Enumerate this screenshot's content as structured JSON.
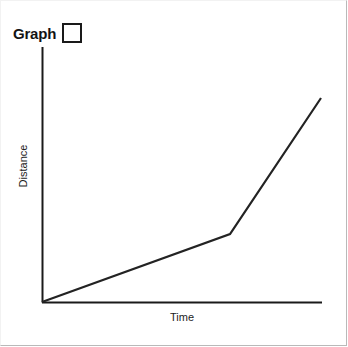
{
  "title": {
    "label": "Graph",
    "checkbox_checked": false,
    "checkbox_name": "graph-checkbox"
  },
  "colors": {
    "axis": "#1a1a1a",
    "line": "#232323",
    "background": "#ffffff",
    "frame": "#b9b9b9",
    "text": "#1d1d1d"
  },
  "chart_data": {
    "type": "line",
    "title": "Graph",
    "xlabel": "Time",
    "ylabel": "Distance",
    "grid": false,
    "legend": null,
    "axis_ticks": {
      "x": [],
      "y": []
    },
    "xlim": [
      0,
      10
    ],
    "ylim": [
      0,
      10
    ],
    "series": [
      {
        "name": "Distance vs Time",
        "x": [
          0,
          6.7,
          10.0
        ],
        "y": [
          0,
          2.7,
          8.0
        ],
        "points_px": [
          [
            42,
            302
          ],
          [
            230,
            234
          ],
          [
            321,
            98
          ]
        ],
        "description": "Two straight segments: a shallow constant-slope rise followed by a steeper constant-slope rise."
      }
    ],
    "annotations": []
  },
  "axes": {
    "y_axis_label": "Distance",
    "x_axis_label": "Time",
    "origin_px": [
      42,
      302
    ],
    "y_axis_top_px": [
      42,
      47
    ],
    "x_axis_right_px": [
      322,
      302
    ]
  }
}
